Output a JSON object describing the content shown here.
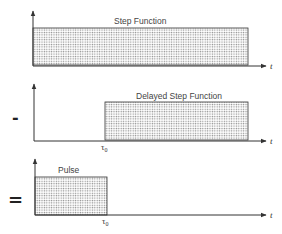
{
  "diagram": {
    "panels": [
      {
        "title": "Step Function",
        "operator": "",
        "axis_label": "t",
        "marker": ""
      },
      {
        "title": "Delayed Step Function",
        "operator": "-",
        "axis_label": "t",
        "marker": "τ",
        "marker_sub": "0"
      },
      {
        "title": "Pulse",
        "operator": "=",
        "axis_label": "t",
        "marker": "τ",
        "marker_sub": "0"
      }
    ],
    "colors": {
      "line": "#333333",
      "fill_dot": "#8a8a8a",
      "text": "#444444"
    }
  }
}
